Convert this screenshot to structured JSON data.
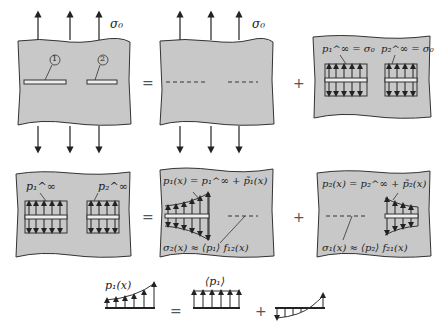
{
  "figure": {
    "colors": {
      "plate_fill": "#c8c8c8",
      "stroke": "#333333",
      "background": "#ffffff"
    },
    "row1": {
      "sigma_top": "σ₀",
      "crack_labels": [
        "1",
        "2"
      ],
      "operator_equals": "=",
      "operator_plus": "+",
      "panel3_labels": {
        "p1": "p₁^∞ = σ₀",
        "p2": "p₂^∞ = σ₀"
      }
    },
    "row2": {
      "panel1_labels": {
        "p1": "p₁^∞",
        "p2": "p₂^∞"
      },
      "operator_equals": "=",
      "operator_plus": "+",
      "panel2_labels": {
        "top": "p₁(x) = p₁^∞ + p̃₁(x)",
        "bottom": "σ₂(x) ≈ ⟨p₁⟩ f₁₂(x)"
      },
      "panel3_labels": {
        "top": "p₂(x) = p₂^∞ + p̃₂(x)",
        "bottom": "σ₁(x) ≈ ⟨p₂⟩ f₂₁(x)"
      }
    },
    "row3": {
      "left_label": "p₁(x)",
      "operator_equals": "=",
      "middle_label": "⟨p₁⟩",
      "operator_plus": "+"
    }
  }
}
